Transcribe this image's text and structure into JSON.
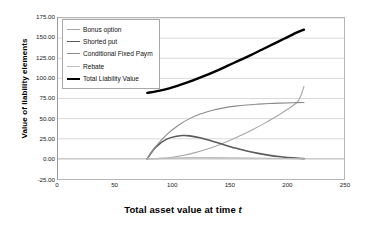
{
  "chart_data": {
    "type": "line",
    "title": "",
    "xlabel": "Total asset value at time t",
    "ylabel": "Value of liability elements",
    "xlim": [
      0,
      250
    ],
    "ylim": [
      -25.0,
      175.0
    ],
    "xticks": [
      "0",
      "50",
      "100",
      "150",
      "200",
      "250"
    ],
    "xtick_values": [
      0,
      50,
      100,
      150,
      200,
      250
    ],
    "yticks": [
      "-25.00",
      "0.00",
      "25.00",
      "50.00",
      "75.00",
      "100.00",
      "125.00",
      "150.00",
      "175.00"
    ],
    "ytick_values": [
      -25,
      0,
      25,
      50,
      75,
      100,
      125,
      150,
      175
    ],
    "grid": true,
    "grid_axis": "y",
    "legend_position": "upper-left-inside",
    "series": [
      {
        "name": "Bonus option",
        "color": "#a6a6a6",
        "width": 1.1,
        "x": [
          78,
          90,
          100,
          110,
          120,
          130,
          140,
          150,
          160,
          170,
          180,
          190,
          200,
          210,
          215
        ],
        "values": [
          0,
          0.6,
          2.0,
          4.4,
          7.8,
          12.0,
          17.0,
          22.8,
          29.2,
          36.2,
          43.8,
          52.0,
          61.0,
          72.0,
          90.0
        ]
      },
      {
        "name": "Shorted put",
        "color": "#5b5b5b",
        "width": 1.6,
        "x": [
          78,
          85,
          95,
          105,
          110,
          115,
          125,
          135,
          145,
          155,
          165,
          175,
          185,
          195,
          205,
          215
        ],
        "values": [
          0,
          14.0,
          24.5,
          28.5,
          29.0,
          28.6,
          26.0,
          22.0,
          17.6,
          13.4,
          9.8,
          6.8,
          4.4,
          2.6,
          1.2,
          0.3
        ]
      },
      {
        "name": "Conditional Fixed Paym",
        "color": "#8c8c8c",
        "width": 1.1,
        "x": [
          78,
          85,
          95,
          105,
          115,
          125,
          135,
          145,
          155,
          165,
          175,
          185,
          195,
          205,
          215
        ],
        "values": [
          0,
          14.5,
          30.0,
          41.5,
          50.0,
          56.0,
          60.4,
          63.4,
          65.5,
          67.0,
          68.0,
          68.8,
          69.3,
          69.7,
          70.0
        ]
      },
      {
        "name": "Rebate",
        "color": "#bdbdbd",
        "width": 1.1,
        "x": [
          78,
          85,
          95,
          105,
          115,
          125,
          140,
          155,
          170,
          185,
          200,
          215
        ],
        "values": [
          0,
          0.3,
          0.8,
          1.3,
          1.6,
          1.7,
          1.6,
          1.3,
          1.0,
          0.7,
          0.4,
          0.2
        ]
      },
      {
        "name": "Total Liability Value",
        "color": "#000000",
        "width": 2.4,
        "x": [
          78,
          88,
          98,
          108,
          118,
          128,
          138,
          148,
          158,
          168,
          178,
          188,
          198,
          208,
          215
        ],
        "values": [
          82.0,
          84.5,
          88.0,
          92.5,
          97.5,
          103.0,
          109.0,
          115.5,
          122.0,
          128.5,
          135.5,
          142.5,
          149.5,
          156.5,
          160.5
        ]
      }
    ]
  },
  "legend": {
    "items": [
      {
        "label": "Bonus option"
      },
      {
        "label": "Shorted put"
      },
      {
        "label": "Conditional Fixed Paym"
      },
      {
        "label": "Rebate"
      },
      {
        "label": "Total Liability Value"
      }
    ]
  },
  "axis_titles": {
    "x_prefix": "Total asset value at time ",
    "x_italic": "t",
    "y": "Value of liability elements"
  }
}
